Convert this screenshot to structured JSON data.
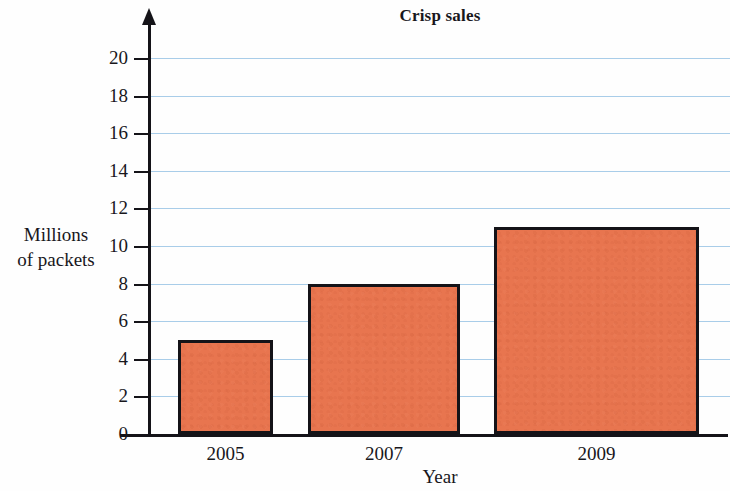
{
  "chart_data": {
    "type": "bar",
    "title": "Crisp sales",
    "xlabel": "Year",
    "ylabel_line1": "Millions",
    "ylabel_line2": "of packets",
    "ylabel": "Millions of packets",
    "categories": [
      "2005",
      "2007",
      "2009"
    ],
    "values": [
      5,
      8,
      11
    ],
    "ylim": [
      0,
      20
    ],
    "xlim_categories": 3,
    "y_ticks": [
      0,
      2,
      4,
      6,
      8,
      10,
      12,
      14,
      16,
      18,
      20
    ],
    "y_tick_labels": [
      "0",
      "2",
      "4",
      "6",
      "8",
      "10",
      "12",
      "14",
      "16",
      "18",
      "20"
    ],
    "grid": true,
    "grid_axis": "y",
    "legend": null,
    "series": [
      {
        "name": "Crisp sales",
        "values": [
          5,
          8,
          11
        ]
      }
    ],
    "bar_fill_color": "#e8754f",
    "bar_edge_color": "#141318",
    "gridline_color": "#a9cde9",
    "axis_color": "#141318",
    "background_color": "#ffffff"
  }
}
